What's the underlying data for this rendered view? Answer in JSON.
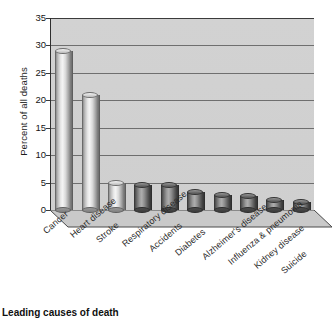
{
  "chart_data": {
    "type": "bar",
    "title": "",
    "caption": "Leading causes of death",
    "xlabel": "",
    "ylabel": "Percent of all deaths",
    "ylim": [
      0,
      35
    ],
    "yticks": [
      0,
      5,
      10,
      15,
      20,
      25,
      30,
      35
    ],
    "grid": true,
    "legend": "none",
    "style": "3d-cylinder",
    "categories": [
      "Cancer",
      "Heart disease",
      "Stroke",
      "Respiratory disease",
      "Accidents",
      "Diabetes",
      "Alzheimer's disease",
      "Influenza & pneumonia",
      "Kidney disease",
      "Suicide"
    ],
    "values": [
      29,
      21,
      5,
      4.5,
      4.5,
      3.2,
      2.8,
      2.5,
      1.8,
      1.5
    ],
    "bar_shades": [
      "light",
      "light",
      "light",
      "dark",
      "dark",
      "dark",
      "dark",
      "dark",
      "dark",
      "dark"
    ]
  },
  "colors": {
    "plot_background": "#d0d0d0",
    "gridline": "#4d4d4d",
    "axis": "#2e2e2e",
    "text": "#1c1c1c",
    "page_background": "#ffffff"
  }
}
